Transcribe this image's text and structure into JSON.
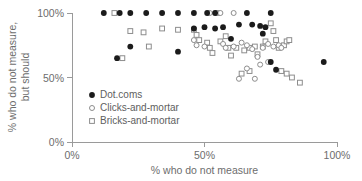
{
  "chart_data": {
    "type": "scatter",
    "title": "",
    "xlabel": "% who do not measure",
    "ylabel_line1": "% who do not measure,",
    "ylabel_line2": "but should",
    "xlim": [
      0,
      100
    ],
    "ylim": [
      0,
      100
    ],
    "xticks": [
      0,
      50,
      100
    ],
    "yticks": [
      0,
      50,
      100
    ],
    "xticklabels": [
      "0%",
      "50%",
      "100%"
    ],
    "yticklabels": [
      "0%",
      "50%",
      "100%"
    ],
    "grid": false,
    "legend_position": "inside-lower-left",
    "marker_colors": {
      "dotcoms_fill": "#1b1b1b",
      "open_stroke": "#8d8d8d",
      "open_fill": "#ffffff",
      "axis": "#9a9a9a",
      "text": "#6d6d6d"
    },
    "series": [
      {
        "name": "Dot.coms",
        "marker": "filled-circle",
        "points": [
          [
            12,
            100
          ],
          [
            18,
            100
          ],
          [
            22,
            100
          ],
          [
            28,
            100
          ],
          [
            34,
            100
          ],
          [
            40,
            100
          ],
          [
            46,
            100
          ],
          [
            51,
            100
          ],
          [
            54,
            100
          ],
          [
            66,
            100
          ],
          [
            75,
            100
          ],
          [
            17,
            65
          ],
          [
            22,
            74
          ],
          [
            40,
            70
          ],
          [
            46,
            88
          ],
          [
            50,
            89
          ],
          [
            54,
            88
          ],
          [
            57,
            89
          ],
          [
            60,
            80
          ],
          [
            63,
            91
          ],
          [
            68,
            91
          ],
          [
            72,
            84
          ],
          [
            71,
            90
          ],
          [
            73,
            89
          ],
          [
            75,
            62
          ],
          [
            77,
            56
          ],
          [
            95,
            62
          ]
        ]
      },
      {
        "name": "Clicks-and-mortar",
        "marker": "open-circle",
        "points": [
          [
            52,
            100
          ],
          [
            56,
            100
          ],
          [
            61,
            100
          ],
          [
            46,
            79
          ],
          [
            47,
            75
          ],
          [
            50,
            74
          ],
          [
            57,
            76
          ],
          [
            58,
            73
          ],
          [
            61,
            74
          ],
          [
            64,
            77
          ],
          [
            66,
            75
          ],
          [
            68,
            72
          ],
          [
            70,
            66
          ],
          [
            71,
            60
          ],
          [
            72,
            73
          ],
          [
            66,
            57
          ],
          [
            63,
            49
          ],
          [
            69,
            49
          ],
          [
            74,
            76
          ],
          [
            76,
            74
          ],
          [
            78,
            75
          ],
          [
            74,
            62
          ],
          [
            79,
            73
          ]
        ]
      },
      {
        "name": "Bricks-and-mortar",
        "marker": "open-square",
        "points": [
          [
            16,
            100
          ],
          [
            55,
            100
          ],
          [
            22,
            86
          ],
          [
            27,
            85
          ],
          [
            34,
            88
          ],
          [
            40,
            87
          ],
          [
            19,
            65
          ],
          [
            29,
            74
          ],
          [
            46,
            87
          ],
          [
            47,
            83
          ],
          [
            48,
            79
          ],
          [
            51,
            77
          ],
          [
            52,
            73
          ],
          [
            53,
            69
          ],
          [
            56,
            78
          ],
          [
            58,
            82
          ],
          [
            59,
            73
          ],
          [
            60,
            67
          ],
          [
            62,
            73
          ],
          [
            65,
            71
          ],
          [
            67,
            73
          ],
          [
            69,
            74
          ],
          [
            70,
            68
          ],
          [
            72,
            74
          ],
          [
            73,
            78
          ],
          [
            75,
            92
          ],
          [
            76,
            86
          ],
          [
            77,
            79
          ],
          [
            78,
            73
          ],
          [
            80,
            75
          ],
          [
            81,
            78
          ],
          [
            82,
            79
          ],
          [
            79,
            55
          ],
          [
            81,
            53
          ],
          [
            83,
            50
          ],
          [
            86,
            46
          ],
          [
            64,
            53
          ],
          [
            67,
            55
          ]
        ]
      }
    ]
  },
  "legend": {
    "items": [
      {
        "label": "Dot.coms",
        "marker": "filled-circle"
      },
      {
        "label": "Clicks-and-mortar",
        "marker": "open-circle"
      },
      {
        "label": "Bricks-and-mortar",
        "marker": "open-square"
      }
    ]
  }
}
